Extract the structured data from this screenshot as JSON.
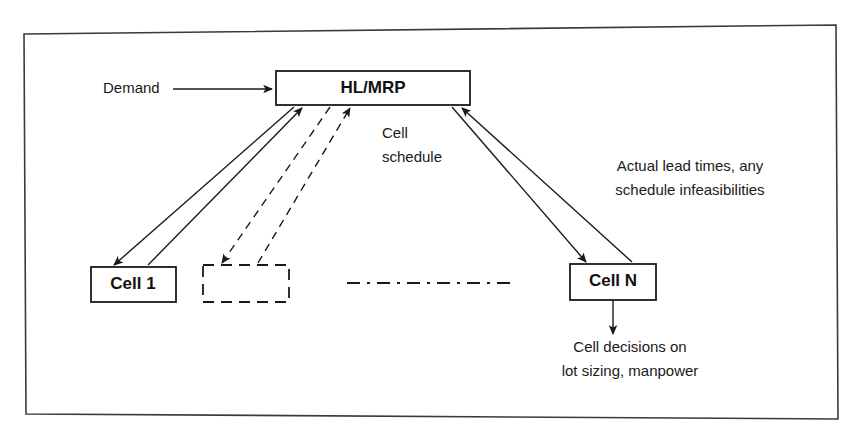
{
  "diagram": {
    "background_color": "#ffffff",
    "line_color": "#1a1a1a",
    "frame_color": "#3a3a3a",
    "nodes": {
      "hl_mrp": {
        "label": "HL/MRP",
        "style": "solid"
      },
      "cell_1": {
        "label": "Cell 1",
        "style": "solid"
      },
      "cell_placeholder": {
        "label": "",
        "style": "dashed"
      },
      "cell_n": {
        "label": "Cell N",
        "style": "solid"
      }
    },
    "labels": {
      "demand": "Demand",
      "cell_schedule_line1": "Cell",
      "cell_schedule_line2": "schedule",
      "feedback_line1": "Actual lead times, any",
      "feedback_line2": "schedule infeasibilities",
      "cell_decisions_line1": "Cell decisions on",
      "cell_decisions_line2": "lot sizing, manpower"
    }
  }
}
